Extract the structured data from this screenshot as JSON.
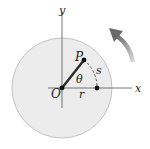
{
  "diagram": {
    "title": "",
    "labels": {
      "y_axis": "y",
      "x_axis": "x",
      "origin": "O",
      "point": "P",
      "angle": "θ",
      "arc_length": "s",
      "radius": "r"
    },
    "colors": {
      "disk_fill": "#ebebeb",
      "disk_stroke": "#b5b5b5",
      "axis": "#555555",
      "radius_line": "#2a2a2a",
      "arrow": "#8a8a8a"
    },
    "rotation_direction": "counterclockwise"
  }
}
